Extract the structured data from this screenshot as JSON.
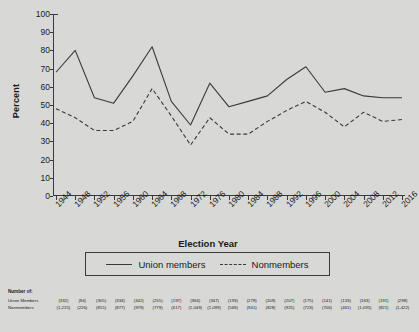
{
  "chart_data": {
    "type": "line",
    "title": "",
    "xlabel": "Election Year",
    "ylabel": "Percent",
    "ylim": [
      0,
      100
    ],
    "ytick_step": 10,
    "grid": false,
    "legend_position": "below-axes",
    "categories": [
      1944,
      1948,
      1952,
      1956,
      1960,
      1964,
      1968,
      1972,
      1976,
      1980,
      1984,
      1988,
      1992,
      1996,
      2000,
      2004,
      2008,
      2012,
      2016
    ],
    "yticks": [
      "0",
      "10",
      "20",
      "30",
      "40",
      "50",
      "60",
      "70",
      "80",
      "90",
      "100"
    ],
    "xticklabels": [
      "1944",
      "1948",
      "1952",
      "1956",
      "1960",
      "1964",
      "1968",
      "1972",
      "1976",
      "1980",
      "1984",
      "1988",
      "1992",
      "1996",
      "2000",
      "2004",
      "2008",
      "2012",
      "2016"
    ],
    "series": [
      {
        "name": "Union members",
        "style": "solid",
        "color": "#3a3a3a",
        "values": [
          68,
          80,
          54,
          51,
          66,
          82,
          52,
          39,
          62,
          49,
          52,
          55,
          64,
          71,
          57,
          59,
          55,
          54,
          54
        ]
      },
      {
        "name": "Nonmembers",
        "style": "dashed",
        "color": "#3a3a3a",
        "values": [
          48,
          43,
          36,
          36,
          41,
          59,
          44,
          28,
          43,
          34,
          34,
          41,
          47,
          52,
          46,
          38,
          46,
          41,
          42
        ]
      }
    ]
  },
  "axis": {
    "ylabel": "Percent",
    "xlabel": "Election Year"
  },
  "legend": {
    "items": [
      {
        "label": "Union members",
        "style": "solid"
      },
      {
        "label": "Nonmembers",
        "style": "dashed"
      }
    ]
  },
  "footnote": {
    "title": "Number of:",
    "rows": [
      {
        "label": "Union Members",
        "values": [
          "(332)",
          "(94)",
          "(305)",
          "(334)",
          "(342)",
          "(255)",
          "(197)",
          "(366)",
          "(347)",
          "(193)",
          "(278)",
          "(209)",
          "(207)",
          "(175)",
          "(141)",
          "(133)",
          "(163)",
          "(191)",
          "(298)"
        ]
      },
      {
        "label": "Nonmembers",
        "values": [
          "(1,215)",
          "(226)",
          "(815)",
          "(877)",
          "(979)",
          "(779)",
          "(617)",
          "(1,049)",
          "(1,099)",
          "(569)",
          "(941)",
          "(828)",
          "(925)",
          "(723)",
          "(706)",
          "(461)",
          "(1,095)",
          "(821)",
          "(1,422)"
        ]
      }
    ]
  },
  "colors": {
    "background": "#d8d8d6",
    "ink": "#3a3a3a"
  }
}
